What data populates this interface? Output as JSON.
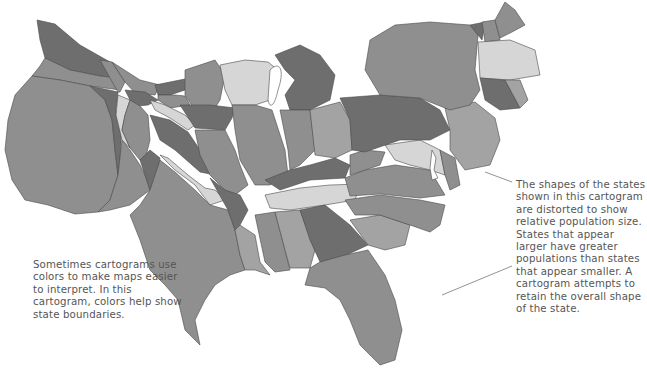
{
  "figure": {
    "colors": {
      "dark": "#6e6e6e",
      "medium": "#8f8f8f",
      "light": "#d6d6d6",
      "mediumlight": "#a3a3a3",
      "background": "#ffffff",
      "text": "#555555"
    }
  },
  "annotations": {
    "left": "Sometimes cartograms use colors to make maps easier to interpret. In this cartogram, colors help show state boundaries.",
    "right": "The shapes of the states shown in this cartogram are distorted to show relative population size. States that appear larger have greater populations than states that appear smaller. A cartogram attempts to retain the overall shape of the state."
  },
  "regions": [
    {
      "name": "Washington",
      "tone": "dark"
    },
    {
      "name": "Oregon",
      "tone": "medium"
    },
    {
      "name": "California",
      "tone": "medium"
    },
    {
      "name": "Nevada",
      "tone": "dark"
    },
    {
      "name": "Idaho",
      "tone": "medium"
    },
    {
      "name": "Montana",
      "tone": "medium"
    },
    {
      "name": "Wyoming",
      "tone": "dark"
    },
    {
      "name": "Utah",
      "tone": "light"
    },
    {
      "name": "Arizona",
      "tone": "medium"
    },
    {
      "name": "Colorado",
      "tone": "medium"
    },
    {
      "name": "New Mexico",
      "tone": "dark"
    },
    {
      "name": "North Dakota",
      "tone": "dark"
    },
    {
      "name": "South Dakota",
      "tone": "medium"
    },
    {
      "name": "Nebraska",
      "tone": "light"
    },
    {
      "name": "Kansas",
      "tone": "dark"
    },
    {
      "name": "Oklahoma",
      "tone": "light"
    },
    {
      "name": "Texas",
      "tone": "medium"
    },
    {
      "name": "Minnesota",
      "tone": "medium"
    },
    {
      "name": "Iowa",
      "tone": "dark"
    },
    {
      "name": "Missouri",
      "tone": "medium"
    },
    {
      "name": "Arkansas",
      "tone": "dark"
    },
    {
      "name": "Louisiana",
      "tone": "mediumlight"
    },
    {
      "name": "Wisconsin",
      "tone": "light"
    },
    {
      "name": "Illinois",
      "tone": "medium"
    },
    {
      "name": "Michigan",
      "tone": "dark"
    },
    {
      "name": "Indiana",
      "tone": "medium"
    },
    {
      "name": "Ohio",
      "tone": "mediumlight"
    },
    {
      "name": "Kentucky",
      "tone": "dark"
    },
    {
      "name": "Tennessee",
      "tone": "light"
    },
    {
      "name": "Mississippi",
      "tone": "medium"
    },
    {
      "name": "Alabama",
      "tone": "mediumlight"
    },
    {
      "name": "Georgia",
      "tone": "dark"
    },
    {
      "name": "Florida",
      "tone": "medium"
    },
    {
      "name": "South Carolina",
      "tone": "mediumlight"
    },
    {
      "name": "North Carolina",
      "tone": "medium"
    },
    {
      "name": "Virginia",
      "tone": "medium"
    },
    {
      "name": "West Virginia",
      "tone": "medium"
    },
    {
      "name": "Maryland",
      "tone": "light"
    },
    {
      "name": "Delaware",
      "tone": "medium"
    },
    {
      "name": "Pennsylvania",
      "tone": "dark"
    },
    {
      "name": "New Jersey",
      "tone": "mediumlight"
    },
    {
      "name": "New York",
      "tone": "medium"
    },
    {
      "name": "Vermont",
      "tone": "dark"
    },
    {
      "name": "New Hampshire",
      "tone": "medium"
    },
    {
      "name": "Maine",
      "tone": "medium"
    },
    {
      "name": "Massachusetts",
      "tone": "light"
    },
    {
      "name": "Connecticut",
      "tone": "dark"
    },
    {
      "name": "Rhode Island",
      "tone": "mediumlight"
    }
  ]
}
